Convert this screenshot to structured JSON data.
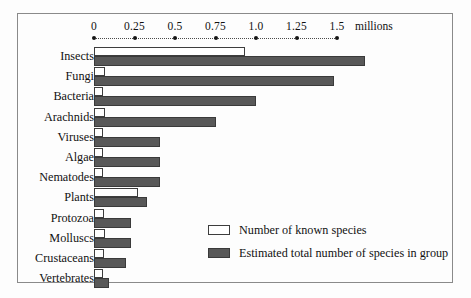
{
  "chart_data": {
    "type": "bar",
    "orientation": "horizontal",
    "title": "",
    "xlabel": "millions",
    "ylabel": "",
    "xlim": [
      0,
      1.62
    ],
    "grid": false,
    "legend_position": "inside-right-lower",
    "axis_ticks": [
      "0",
      "0.25",
      "0.5",
      "0.75",
      "1.0",
      "1.25",
      "1.5"
    ],
    "axis_tick_values": [
      0,
      0.25,
      0.5,
      0.75,
      1.0,
      1.25,
      1.5
    ],
    "units_label": "millions",
    "categories": [
      "Insects",
      "Fungi",
      "Bacteria",
      "Arachnids",
      "Viruses",
      "Algae",
      "Nematodes",
      "Plants",
      "Protozoa",
      "Molluscs",
      "Crustaceans",
      "Vertebrates"
    ],
    "series": [
      {
        "name": "Number of known species",
        "color": "#ffffff",
        "values": [
          0.93,
          0.07,
          0.03,
          0.07,
          0.02,
          0.05,
          0.04,
          0.27,
          0.06,
          0.07,
          0.06,
          0.05
        ]
      },
      {
        "name": "Estimated total number of species in group",
        "color": "#585858",
        "values": [
          1.67,
          1.48,
          1.0,
          0.75,
          0.41,
          0.41,
          0.41,
          0.33,
          0.23,
          0.23,
          0.2,
          0.09
        ]
      }
    ]
  },
  "legend": {
    "items": [
      {
        "label": "Number of known species",
        "swatch": "known"
      },
      {
        "label": "Estimated total number of species in group",
        "swatch": "total"
      }
    ]
  }
}
